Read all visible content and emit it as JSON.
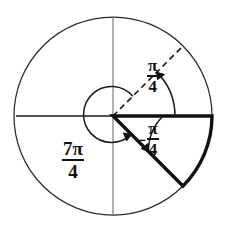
{
  "figure": {
    "type": "unit-circle-angle-diagram",
    "title": "",
    "center": {
      "x": 113,
      "y": 116
    },
    "radius": 99,
    "colors": {
      "stroke": "#111111",
      "axis": "#6b6b6b",
      "circle": "#2a2a2a",
      "background": "#ffffff"
    },
    "circle": {
      "cx": 113,
      "cy": 116,
      "r": 99,
      "stroke_width": 1.2
    },
    "axes": {
      "horizontal": {
        "x1": 16,
        "y1": 116,
        "x2": 212,
        "y2": 116,
        "stroke_width": 1.4
      },
      "vertical": {
        "x1": 113,
        "y1": 16,
        "x2": 113,
        "y2": 216,
        "stroke_width": 1.0
      }
    },
    "terminal_rays": [
      {
        "name": "dashed-ray-pi-over-4",
        "angle_deg": 45,
        "style": "dashed",
        "x1": 113,
        "y1": 116,
        "x2": 183,
        "y2": 46
      },
      {
        "name": "thick-ray-negative-pi-over-4",
        "angle_deg": -45,
        "style": "solid-thick",
        "x1": 113,
        "y1": 116,
        "x2": 183,
        "y2": 186
      }
    ],
    "sector": {
      "name": "shaded-sector-negative-pi-over-4",
      "start_angle_deg": 0,
      "end_angle_deg": -45,
      "radius": 99,
      "stroke_width": 3.2,
      "fill": "none"
    }
  },
  "arcs": [
    {
      "name": "arc-pi-over-4",
      "label_key": "pi_over_4",
      "from_angle_deg": 0,
      "to_angle_deg": 45,
      "direction": "counterclockwise",
      "radius": 62,
      "arrow_at": "end"
    },
    {
      "name": "arc-negative-pi-over-4",
      "label_key": "negative_pi_over_4",
      "from_angle_deg": 0,
      "to_angle_deg": -45,
      "direction": "clockwise",
      "radius": 50,
      "arrow_at": "end"
    },
    {
      "name": "arc-7pi-over-4",
      "label_key": "seven_pi_over_4",
      "from_angle_deg": 45,
      "to_angle_deg": -45,
      "direction": "counterclockwise",
      "radius": 28,
      "arrow_at": "end"
    }
  ],
  "labels": {
    "pi_over_4": {
      "sign": "",
      "numerator": "π",
      "denominator": "4",
      "text": "π/4",
      "x": 146,
      "y": 57
    },
    "negative_pi_over_4": {
      "sign": "−",
      "numerator": "π",
      "denominator": "4",
      "text": "−π/4",
      "x": 136,
      "y": 120
    },
    "seven_pi_over_4": {
      "sign": "",
      "numerator": "7π",
      "denominator": "4",
      "text": "7π/4",
      "x": 62,
      "y": 139
    }
  }
}
